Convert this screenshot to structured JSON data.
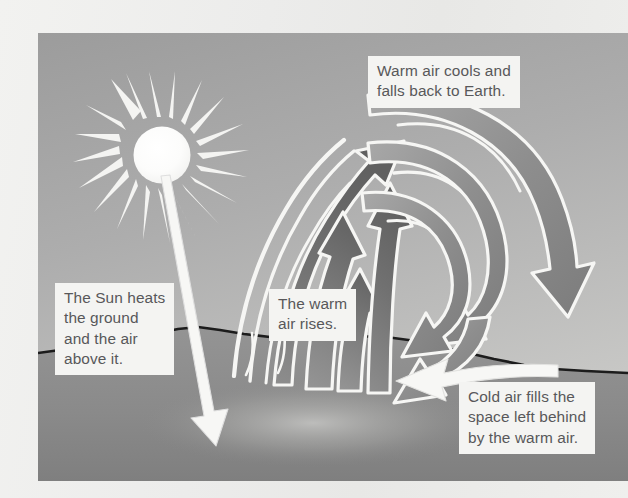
{
  "page": {
    "background_color": "#efefed"
  },
  "figure": {
    "sky_color_top": "#a0a0a0",
    "sky_color_bottom": "#c3c3c3",
    "ground_color": "#8e8e8e",
    "ground_outline_color": "#1a1a1a",
    "arrow_dark_color": "#6e6e6e",
    "arrow_light_color": "#f6f6f4",
    "sun_color": "#fbfbfa"
  },
  "icons": {
    "sun": "sun-icon",
    "ground": "ground-icon",
    "rising_arrow": "up-arrow-icon",
    "falling_arrow": "curved-down-arrow-icon",
    "sunray_arrow": "sunray-arrow-icon",
    "cold_air_arrow": "left-arrow-icon"
  },
  "captions": {
    "warm_cools": "Warm air cools and\nfalls back to Earth.",
    "sun_heats": "The Sun heats\nthe ground\nand the air\nabove it.",
    "warm_rises": "The warm\nair rises.",
    "cold_fills": "Cold air fills the\nspace left behind\nby the warm air."
  }
}
